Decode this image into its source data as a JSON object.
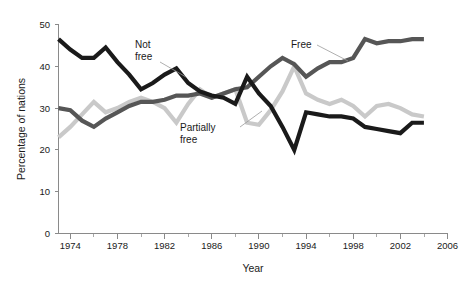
{
  "chart_data": {
    "type": "line",
    "title": "",
    "subtitle": "",
    "xlabel": "Year",
    "ylabel": "Percentage of nations",
    "xlim": [
      1973,
      2006
    ],
    "ylim": [
      0,
      50
    ],
    "grid": false,
    "legend_position": "inline-annotations",
    "x_ticks": [
      "1974",
      "1978",
      "1982",
      "1986",
      "1990",
      "1994",
      "1998",
      "2002",
      "2006"
    ],
    "x_tick_values": [
      1974,
      1978,
      1982,
      1986,
      1990,
      1994,
      1998,
      2002,
      2006
    ],
    "x_minor_tick_values": [
      1976,
      1980,
      1984,
      1988,
      1992,
      1996,
      2000,
      2004
    ],
    "y_ticks": [
      "0",
      "10",
      "20",
      "30",
      "40",
      "50"
    ],
    "y_tick_values": [
      0,
      10,
      20,
      30,
      40,
      50
    ],
    "x": [
      1973,
      1974,
      1975,
      1976,
      1977,
      1978,
      1979,
      1980,
      1981,
      1982,
      1983,
      1984,
      1985,
      1986,
      1987,
      1988,
      1989,
      1990,
      1991,
      1992,
      1993,
      1994,
      1995,
      1996,
      1997,
      1998,
      1999,
      2000,
      2001,
      2002,
      2003,
      2004
    ],
    "series": [
      {
        "name": "Not free",
        "color": "#1a1a1a",
        "values": [
          46.5,
          44.0,
          42.0,
          42.0,
          44.5,
          41.0,
          38.0,
          34.5,
          36.0,
          38.0,
          39.5,
          36.0,
          34.0,
          33.0,
          32.5,
          31.0,
          37.5,
          33.5,
          30.5,
          25.5,
          20.0,
          29.0,
          28.5,
          28.0,
          28.0,
          27.5,
          25.5,
          25.0,
          24.5,
          24.0,
          26.5,
          26.5
        ]
      },
      {
        "name": "Free",
        "color": "#565656",
        "values": [
          30.0,
          29.5,
          27.0,
          25.5,
          27.5,
          29.0,
          30.5,
          31.5,
          31.5,
          32.0,
          33.0,
          33.0,
          33.5,
          32.5,
          33.5,
          34.5,
          35.0,
          37.5,
          40.0,
          42.0,
          40.5,
          37.5,
          39.5,
          41.0,
          41.0,
          42.0,
          46.5,
          45.5,
          46.0,
          46.0,
          46.5,
          46.5
        ]
      },
      {
        "name": "Partially free",
        "color": "#c9c9c9",
        "values": [
          23.0,
          25.5,
          28.5,
          31.5,
          29.0,
          30.0,
          31.5,
          32.5,
          31.5,
          30.0,
          26.5,
          31.0,
          34.5,
          32.5,
          33.5,
          34.5,
          26.5,
          26.0,
          29.5,
          34.0,
          40.0,
          33.5,
          32.0,
          31.0,
          32.0,
          30.5,
          28.0,
          30.5,
          31.0,
          30.0,
          28.5,
          28.0
        ]
      }
    ],
    "annotations": [
      {
        "text_line1": "Not",
        "text_line2": "free",
        "series": "Not free"
      },
      {
        "text_line1": "Free",
        "text_line2": "",
        "series": "Free"
      },
      {
        "text_line1": "Partially",
        "text_line2": "free",
        "series": "Partially free"
      }
    ]
  },
  "axes": {
    "y_axis_title": "Percentage of nations",
    "x_axis_title": "Year"
  }
}
